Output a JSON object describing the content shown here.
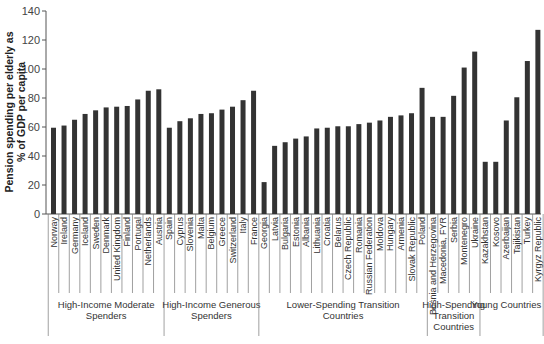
{
  "chart_data": {
    "type": "bar",
    "title": "",
    "xlabel": "",
    "ylabel": "Pension spending per elderly as % of GDP per capita",
    "ylabel_lines": [
      "Pension spending per elderly as",
      "% of GDP per capita"
    ],
    "ylim": [
      0,
      140
    ],
    "yticks": [
      0,
      20,
      40,
      60,
      80,
      100,
      120,
      140
    ],
    "grid": false,
    "legend": null,
    "bar_color": "#333333",
    "categories": [
      "Norway",
      "Ireland",
      "Germany",
      "Iceland",
      "Sweden",
      "Denmark",
      "United Kingdom",
      "Finland",
      "Portugal",
      "Netherlands",
      "Austria",
      "Spain",
      "Cyprus",
      "Slovenia",
      "Malta",
      "Belgium",
      "Greece",
      "Switzerland",
      "Italy",
      "France",
      "Georgia",
      "Latvia",
      "Bulgaria",
      "Estonia",
      "Albania",
      "Lithuania",
      "Croatia",
      "Belarus",
      "Czech Republic",
      "Romania",
      "Russian Federation",
      "Moldova",
      "Hungary",
      "Armenia",
      "Slovak Republic",
      "Poland",
      "Bosnia and Herzegovina",
      "Macedonia, FYR",
      "Serbia",
      "Montenegro",
      "Ukraine",
      "Kazakhstan",
      "Kosovo",
      "Azerbaijan",
      "Tajikistan",
      "Turkey",
      "Kyrgyz Republic"
    ],
    "values": [
      59.5,
      61,
      65,
      69,
      71.5,
      73.5,
      74,
      74.5,
      79,
      85,
      86,
      59.5,
      64,
      66,
      69,
      69.5,
      72,
      74,
      78.5,
      85,
      22,
      47,
      49.5,
      52,
      53.5,
      59,
      59.5,
      60.5,
      60.5,
      62,
      63,
      64.5,
      67,
      68,
      69.5,
      87,
      67,
      67,
      81.5,
      101,
      112,
      36,
      36,
      64.5,
      80.5,
      105.5,
      127
    ],
    "groups": [
      {
        "label_lines": [
          "High-Income Moderate",
          "Spenders"
        ],
        "count": 11
      },
      {
        "label_lines": [
          "High-Income Generous",
          "Spenders"
        ],
        "count": 9
      },
      {
        "label_lines": [
          "Lower-Spending Transition",
          "Countries"
        ],
        "count": 16
      },
      {
        "label_lines": [
          "High-Spending",
          "Transition",
          "Countries"
        ],
        "count": 5
      },
      {
        "label_lines": [
          "Young Countries"
        ],
        "count": 5
      }
    ]
  }
}
